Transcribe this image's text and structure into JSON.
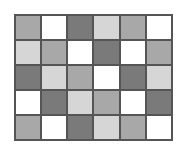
{
  "grid": {
    "columns": 6,
    "rows": 5,
    "palette": {
      "D": "#7a7a7a",
      "M": "#a8a8a8",
      "L": "#d6d6d6",
      "W": "#ffffff"
    },
    "border_color": "#555555",
    "cells": [
      [
        "M",
        "W",
        "D",
        "L",
        "M",
        "W"
      ],
      [
        "L",
        "M",
        "W",
        "D",
        "W",
        "M"
      ],
      [
        "D",
        "L",
        "M",
        "W",
        "D",
        "L"
      ],
      [
        "W",
        "D",
        "L",
        "M",
        "W",
        "D"
      ],
      [
        "M",
        "W",
        "D",
        "L",
        "M",
        "W"
      ]
    ]
  }
}
